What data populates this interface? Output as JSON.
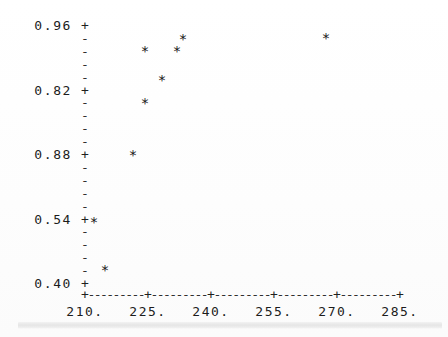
{
  "chart_data": {
    "type": "scatter",
    "title": "",
    "xlabel": "",
    "ylabel": "",
    "grid": false,
    "legend": null,
    "marker": "*",
    "axis_style": "ascii-character-plot",
    "xlim": [
      210,
      285
    ],
    "ylim_labels_top_to_bottom": [
      "0.96",
      "0.82",
      "0.88",
      "0.54",
      "0.40"
    ],
    "x_tick_labels": [
      "210.",
      "225.",
      "240.",
      "255.",
      "270.",
      "285."
    ],
    "x_tick_values": [
      210,
      225,
      240,
      255,
      270,
      285
    ],
    "y_tick_labels": [
      "0.96",
      "0.82",
      "0.88",
      "0.54",
      "0.40"
    ],
    "y_minor_ticks_between_majors": 4,
    "y_major_glyph": "+",
    "y_minor_glyph": "-",
    "x_axis_glyph_line": "+---------+---------+---------+---------+---------+",
    "points": [
      {
        "label": "p1",
        "x": 212.1,
        "y_label_row": "0.54",
        "px": 94,
        "py": 222
      },
      {
        "label": "p2",
        "x": 214.8,
        "y_label_row": "below-0.54",
        "px": 105,
        "py": 270
      },
      {
        "label": "p3",
        "x": 221.4,
        "y_label_row": "0.88",
        "px": 133,
        "py": 155
      },
      {
        "label": "p4",
        "x": 224.3,
        "y_label_row": "between-0.82-0.88",
        "px": 145,
        "py": 103
      },
      {
        "label": "p5",
        "x": 224.3,
        "y_label_row": "near-0.96",
        "px": 145,
        "py": 51
      },
      {
        "label": "p6",
        "x": 228.3,
        "y_label_row": "above-0.82",
        "px": 162,
        "py": 80
      },
      {
        "label": "p7",
        "x": 233.9,
        "y_label_row": "near-0.96",
        "px": 177,
        "py": 51
      },
      {
        "label": "p8",
        "x": 235.3,
        "y_label_row": "near-top",
        "px": 183,
        "py": 39
      },
      {
        "label": "p9",
        "x": 269.3,
        "y_label_row": "near-top",
        "px": 326,
        "py": 38
      }
    ]
  },
  "axis_geometry": {
    "y_axis_column_px": 85,
    "y_top_px": 25,
    "y_bottom_px": 283,
    "y_row_step_px": 12.9,
    "x_left_px": 85,
    "x_right_px": 400,
    "x_tick_step_px": 63,
    "x_axis_y_px": 294,
    "x_label_y_px": 304,
    "y_label_right_px": 72
  }
}
